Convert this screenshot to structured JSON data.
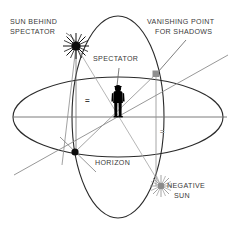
{
  "diagram": {
    "canvas": {
      "width": 239,
      "height": 225,
      "background": "#ffffff"
    },
    "colors": {
      "ink": "#1a1a1a",
      "ellipse": "#2b2b2b",
      "ray_grey": "#8c8c8c",
      "axis_grey": "#707070",
      "label_text": "#3a3a3a",
      "vanishing_marker": "#8f8f8f",
      "negative_sun": "#9a9a9a",
      "figure": "#000000"
    },
    "labels": {
      "sun_behind_spectator": {
        "line1": "SUN BEHIND",
        "line2": "SPECTATOR"
      },
      "vanishing_point_for_shadows": {
        "line1": "VANISHING POINT",
        "line2": "FOR SHADOWS"
      },
      "spectator": "SPECTATOR",
      "horizon": "HORIZON",
      "negative_sun": {
        "line1": "NEGATIVE",
        "line2": "SUN"
      },
      "equal_left": "=",
      "equal_right": "="
    },
    "markers": {
      "sun": {
        "name": "sun-starburst",
        "x": 76,
        "y": 46
      },
      "negative_sun": {
        "name": "negative-sun-starburst",
        "x": 161,
        "y": 186
      },
      "vanishing_point": {
        "name": "vanishing-point-square",
        "x": 156,
        "y": 74
      },
      "shadow_foot_dot": {
        "name": "shadow-foot-dot",
        "x": 75,
        "y": 152
      },
      "spectator_foot": {
        "name": "spectator-foot-point",
        "x": 118,
        "y": 117
      }
    },
    "geometry": {
      "center": {
        "x": 118,
        "y": 117
      },
      "horizon_ellipse": {
        "cx": 118,
        "cy": 117,
        "rx": 105,
        "ry": 40
      },
      "vertical_ellipse": {
        "cx": 118,
        "cy": 117,
        "rx": 46,
        "ry": 101
      },
      "horizon_line": {
        "x1": 13,
        "y1": 117,
        "x2": 227,
        "y2": 117
      },
      "shadow_axis": {
        "x1": 14,
        "y1": 175,
        "x2": 228,
        "y2": 55
      },
      "vertical_drop": {
        "x": 76,
        "y1": 46,
        "y2": 152
      },
      "vanishing_drop": {
        "x": 156,
        "y1": 74,
        "y2": 186
      }
    }
  }
}
